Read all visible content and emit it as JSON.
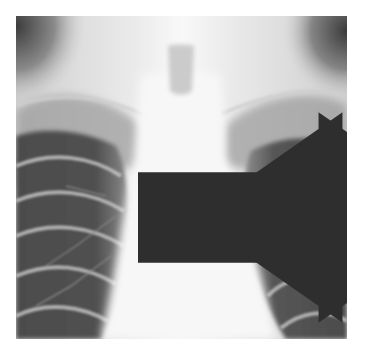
{
  "figure": {
    "colors": {
      "background": "#ffffff",
      "bone_soft_tissue": "#ececec",
      "mediastinum": "#f6f6f6",
      "lung_field": "#4a4a4a",
      "shoulder_shadow": "#555555",
      "arrow": "#2e2e2e"
    },
    "annotations": [
      {
        "type": "arrow",
        "direction": "right",
        "position": "left of trachea"
      },
      {
        "type": "arrow",
        "direction": "left",
        "position": "right of trachea"
      }
    ]
  }
}
